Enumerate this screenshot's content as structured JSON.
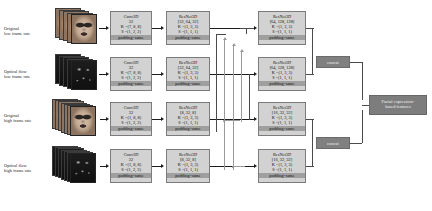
{
  "diagram": {
    "inputs": [
      {
        "id": "in1",
        "label_line1": "Original",
        "label_line2": "low frame rate",
        "kind": "rgb-face-frames"
      },
      {
        "id": "in2",
        "label_line1": "Optical flow",
        "label_line2": "low frame rate",
        "kind": "optical-flow-frames"
      },
      {
        "id": "in3",
        "label_line1": "Original",
        "label_line2": "high frame rate",
        "kind": "rgb-face-frames"
      },
      {
        "id": "in4",
        "label_line1": "Optical flow",
        "label_line2": "high frame rate",
        "kind": "optical-flow-frames"
      }
    ],
    "conv_blocks": [
      {
        "id": "conv1",
        "name": "Conv3D",
        "filters": "32",
        "kernel": "K =(7, 8, 8)",
        "stride": "S =(1, 2, 2)",
        "padding": "padding=same"
      },
      {
        "id": "conv2",
        "name": "Conv3D",
        "filters": "32",
        "kernel": "K =(7, 8, 8)",
        "stride": "S =(1, 2, 2)",
        "padding": "padding=same"
      },
      {
        "id": "conv3",
        "name": "Conv3D",
        "filters": "32",
        "kernel": "K =(1, 8, 8)",
        "stride": "S =(1, 2, 2)",
        "padding": "padding=same"
      },
      {
        "id": "conv4",
        "name": "Conv3D",
        "filters": "32",
        "kernel": "K =(1, 8, 8)",
        "stride": "S =(1, 2, 2)",
        "padding": "padding=same"
      }
    ],
    "resnet_stage1": [
      {
        "id": "res1a",
        "name": "ResNet3D",
        "channels": "[32, 64, 32]",
        "kernel": "K =(1, 3, 3)",
        "stride": "S =(1, 1, 1)",
        "padding": "padding=same"
      },
      {
        "id": "res2a",
        "name": "ResNet3D",
        "channels": "[32, 64, 32]",
        "kernel": "K =(1, 3, 3)",
        "stride": "S =(1, 1, 1)",
        "padding": "padding=same"
      },
      {
        "id": "res3a",
        "name": "ResNet3D",
        "channels": "[8, 32, 8]",
        "kernel": "K =(1, 3, 3)",
        "stride": "S =(1, 1, 1)",
        "padding": "padding=same"
      },
      {
        "id": "res4a",
        "name": "ResNet3D",
        "channels": "[8, 32, 8]",
        "kernel": "K =(1, 3, 3)",
        "stride": "S =(1, 1, 1)",
        "padding": "padding=same"
      }
    ],
    "resnet_stage2": [
      {
        "id": "res1b",
        "name": "ResNet3D",
        "channels": "[64, 128, 128]",
        "kernel": "K =(1, 3, 3)",
        "stride": "S =(1, 1, 1)",
        "padding": "padding=same"
      },
      {
        "id": "res2b",
        "name": "ResNet3D",
        "channels": "[64, 128, 128]",
        "kernel": "K =(1, 3, 3)",
        "stride": "S =(1, 1, 1)",
        "padding": "padding=same"
      },
      {
        "id": "res3b",
        "name": "ResNet3D",
        "channels": "[16, 32, 32]",
        "kernel": "K =(1, 3, 3)",
        "stride": "S =(1, 1, 1)",
        "padding": "padding=same"
      },
      {
        "id": "res4b",
        "name": "ResNet3D",
        "channels": "[16, 32, 32]",
        "kernel": "K =(1, 3, 3)",
        "stride": "S =(1, 1, 1)",
        "padding": "padding=same"
      }
    ],
    "concat_blocks": [
      {
        "id": "concat-top",
        "label": "concat"
      },
      {
        "id": "concat-bottom",
        "label": "concat"
      }
    ],
    "output": {
      "id": "output-features",
      "line1": "Facial expression-",
      "line2": "based features"
    },
    "colors": {
      "block_fill": "#d2d2d2",
      "block_border": "#7b7b7b",
      "padding_highlight": "#9f9f9f",
      "concat_fill": "#808080",
      "output_fill": "#7d7d7d",
      "arrow": "#1c1c1c",
      "lateral_connection": "#9a9a9a",
      "background": "#ffffff"
    }
  }
}
